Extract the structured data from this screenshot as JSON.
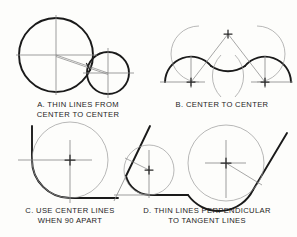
{
  "figure": {
    "background_color": "#fdfdfb",
    "ink_color": "#1a1a1a",
    "construction_line_color": "#8c8c8c"
  },
  "panels": [
    {
      "id": "A",
      "caption_line1": "A. THIN LINES FROM",
      "caption_line2": "CENTER TO CENTER",
      "description": "Two tangent circles joined by a thin line drawn center to center",
      "elements": {
        "large_circle": {
          "cx": 56,
          "cy": 55,
          "r": 37
        },
        "small_circle": {
          "cx": 108,
          "cy": 73,
          "r": 21
        }
      }
    },
    {
      "id": "B",
      "caption_line1": "B. CENTER TO CENTER",
      "caption_line2": "",
      "description": "Two convex arcs joined by a reverse arc with thin center-to-center construction lines meeting at an apex",
      "elements": {
        "left_arc_center": {
          "cx": 191,
          "cy": 82,
          "r": 26
        },
        "right_arc_center": {
          "cx": 265,
          "cy": 82,
          "r": 26
        },
        "apex": {
          "x": 228,
          "y": 34
        }
      }
    },
    {
      "id": "C",
      "caption_line1": "C. USE CENTER LINES",
      "caption_line2": "WHEN 90 APART",
      "description": "A quarter round arc joining two perpendicular lines; center lines locate the arc center",
      "elements": {
        "arc_center": {
          "cx": 70,
          "cy": 160,
          "r": 38
        }
      }
    },
    {
      "id": "D",
      "caption_line1": "D. THIN LINES PERPENDICULAR",
      "caption_line2": "TO TANGENT LINES",
      "description": "Small and large tangent arcs located by thin lines drawn perpendicular to the tangent lines",
      "elements": {
        "small_circle": {
          "cx": 149,
          "cy": 170,
          "r": 25
        },
        "large_circle": {
          "cx": 226,
          "cy": 163,
          "r": 38
        }
      }
    }
  ],
  "marks": {
    "center_cross": "center-mark-cross",
    "tangent_point": "tangent-point-tick"
  }
}
